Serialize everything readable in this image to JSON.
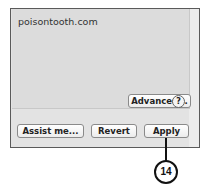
{
  "panel": {
    "domain_text": "poisontooth.com",
    "advanced_label": "Advanced...",
    "help_label": "?"
  },
  "footer": {
    "assist_label": "Assist me...",
    "revert_label": "Revert",
    "apply_label": "Apply"
  },
  "callout": {
    "number": "14"
  }
}
